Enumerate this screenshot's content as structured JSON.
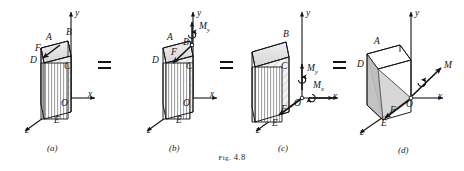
{
  "figure": {
    "caption_prefix": "Fig.",
    "caption_number": "4.8",
    "equals_sign": "=",
    "ink_color": "#1a1a1a",
    "background_color": "#ffffff",
    "shade_color": "#c9c9c9",
    "hatch_color": "#8c8c8c"
  },
  "axes": {
    "x": "x",
    "y": "y",
    "z": "z",
    "origin": "O"
  },
  "panels": [
    {
      "id": "a",
      "label": "(a)",
      "vertex_labels": [
        "A",
        "B",
        "C",
        "D",
        "E",
        "F"
      ],
      "axis_labels": [
        "y",
        "x",
        "z",
        "O"
      ],
      "vectors": [
        {
          "name": "F",
          "label": "F",
          "type": "force",
          "at": "top-edge-AD",
          "direction": "down-left"
        }
      ]
    },
    {
      "id": "b",
      "label": "(b)",
      "vertex_labels": [
        "A",
        "B",
        "C",
        "D",
        "E"
      ],
      "axis_labels": [
        "y",
        "x",
        "z",
        "O"
      ],
      "vectors": [
        {
          "name": "F",
          "label": "F",
          "type": "force",
          "at": "B",
          "direction": "down-left"
        },
        {
          "name": "My",
          "label": "M",
          "sub": "y",
          "type": "couple",
          "at": "B",
          "direction": "up"
        }
      ]
    },
    {
      "id": "c",
      "label": "(c)",
      "vertex_labels": [
        "B",
        "C",
        "E"
      ],
      "axis_labels": [
        "y",
        "x",
        "z",
        "O"
      ],
      "vectors": [
        {
          "name": "F",
          "label": "F",
          "type": "force",
          "at": "O",
          "direction": "down-left"
        },
        {
          "name": "My",
          "label": "M",
          "sub": "y",
          "type": "couple",
          "at": "O",
          "direction": "up"
        },
        {
          "name": "Mx",
          "label": "M",
          "sub": "x",
          "type": "couple",
          "at": "O",
          "direction": "right"
        }
      ]
    },
    {
      "id": "d",
      "label": "(d)",
      "vertex_labels": [
        "A",
        "D",
        "E"
      ],
      "axis_labels": [
        "y",
        "x",
        "z",
        "O"
      ],
      "vectors": [
        {
          "name": "F",
          "label": "F",
          "type": "force",
          "at": "O",
          "direction": "down-left"
        },
        {
          "name": "M",
          "label": "M",
          "type": "couple-resultant",
          "at": "O",
          "direction": "up-right"
        }
      ]
    }
  ]
}
